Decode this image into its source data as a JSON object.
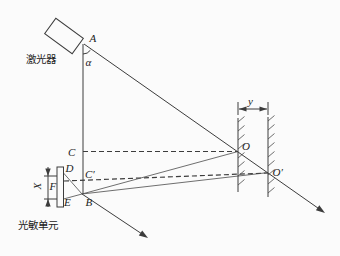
{
  "colors": {
    "ink": "#3c3c3c",
    "background": "#fbfbfb"
  },
  "labels": {
    "laser_device": "激光器",
    "photosensitive_unit": "光敏单元",
    "point_a": "A",
    "angle_alpha": "α",
    "point_c": "C",
    "point_c_prime": "C′",
    "point_o": "O",
    "point_o_prime": "O′",
    "point_d": "D",
    "point_e": "E",
    "point_b": "B",
    "point_f": "F",
    "dim_x": "X",
    "dim_y": "y"
  }
}
